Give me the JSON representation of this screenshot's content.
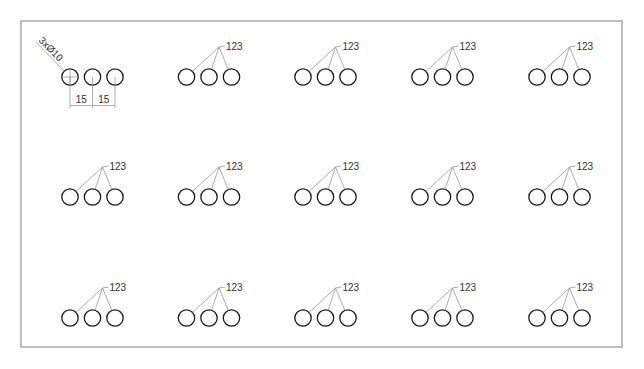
{
  "drawing": {
    "hole_group": {
      "count": 3,
      "hole_diameter": 10,
      "spacing": 15
    },
    "annotations": {
      "hole_callout": "3xØ10",
      "dimension_1": "15",
      "dimension_2": "15",
      "leader_label": "123"
    },
    "grid": {
      "rows": 3,
      "columns": 5
    },
    "groups": [
      {
        "row": 0,
        "col": 0,
        "type": "dimensioned",
        "label": "123"
      },
      {
        "row": 0,
        "col": 1,
        "type": "leader",
        "label": "123"
      },
      {
        "row": 0,
        "col": 2,
        "type": "leader",
        "label": "123"
      },
      {
        "row": 0,
        "col": 3,
        "type": "leader",
        "label": "123"
      },
      {
        "row": 0,
        "col": 4,
        "type": "leader",
        "label": "123"
      },
      {
        "row": 1,
        "col": 0,
        "type": "leader",
        "label": "123"
      },
      {
        "row": 1,
        "col": 1,
        "type": "leader",
        "label": "123"
      },
      {
        "row": 1,
        "col": 2,
        "type": "leader",
        "label": "123"
      },
      {
        "row": 1,
        "col": 3,
        "type": "leader",
        "label": "123"
      },
      {
        "row": 1,
        "col": 4,
        "type": "leader",
        "label": "123"
      },
      {
        "row": 2,
        "col": 0,
        "type": "leader",
        "label": "123"
      },
      {
        "row": 2,
        "col": 1,
        "type": "leader",
        "label": "123"
      },
      {
        "row": 2,
        "col": 2,
        "type": "leader",
        "label": "123"
      },
      {
        "row": 2,
        "col": 3,
        "type": "leader",
        "label": "123"
      },
      {
        "row": 2,
        "col": 4,
        "type": "leader",
        "label": "123"
      }
    ],
    "colors": {
      "frame": "#bdbdbd",
      "hole_stroke": "#1a1a1a",
      "leader_stroke": "#8a8a8a",
      "text": "#333333"
    }
  }
}
